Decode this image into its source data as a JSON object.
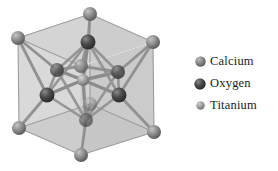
{
  "figure": {
    "background_color": "#ffffff"
  },
  "crystal": {
    "name": "perovskite-unit-cell",
    "cube": {
      "face_color": "#c9c9c9",
      "edge_color": "#9a9a9a",
      "highlight_edge_color": "#f2f2f2"
    },
    "bond_color": "#8c8c8c",
    "atoms": {
      "calcium": {
        "label": "Calcium",
        "color": "#8a8a8a",
        "highlight": "#c4c4c4",
        "radius": 7,
        "positions": [
          {
            "x": 18,
            "y": 38
          },
          {
            "x": 90,
            "y": 14
          },
          {
            "x": 153,
            "y": 42
          },
          {
            "x": 81,
            "y": 66
          },
          {
            "x": 19,
            "y": 128
          },
          {
            "x": 90,
            "y": 104
          },
          {
            "x": 154,
            "y": 132
          },
          {
            "x": 81,
            "y": 155
          }
        ]
      },
      "oxygen": {
        "label": "Oxygen",
        "color": "#4a4a4a",
        "highlight": "#888888",
        "radius": 7,
        "positions": [
          {
            "x": 88,
            "y": 42
          },
          {
            "x": 47,
            "y": 95
          },
          {
            "x": 119,
            "y": 95
          },
          {
            "x": 86,
            "y": 120
          },
          {
            "x": 57,
            "y": 70
          },
          {
            "x": 118,
            "y": 72
          }
        ]
      },
      "titanium": {
        "label": "Titanium",
        "color": "#9e9e9e",
        "highlight": "#d0d0d0",
        "radius": 5,
        "positions": [
          {
            "x": 83,
            "y": 80
          }
        ]
      }
    }
  },
  "legend": {
    "items": [
      {
        "label": "Calcium",
        "color": "#858585",
        "highlight": "#bcbcbc",
        "size": 11
      },
      {
        "label": "Oxygen",
        "color": "#4a4a4a",
        "highlight": "#858585",
        "size": 12
      },
      {
        "label": "Titanium",
        "color": "#9c9c9c",
        "highlight": "#cfcfcf",
        "size": 9
      }
    ]
  }
}
